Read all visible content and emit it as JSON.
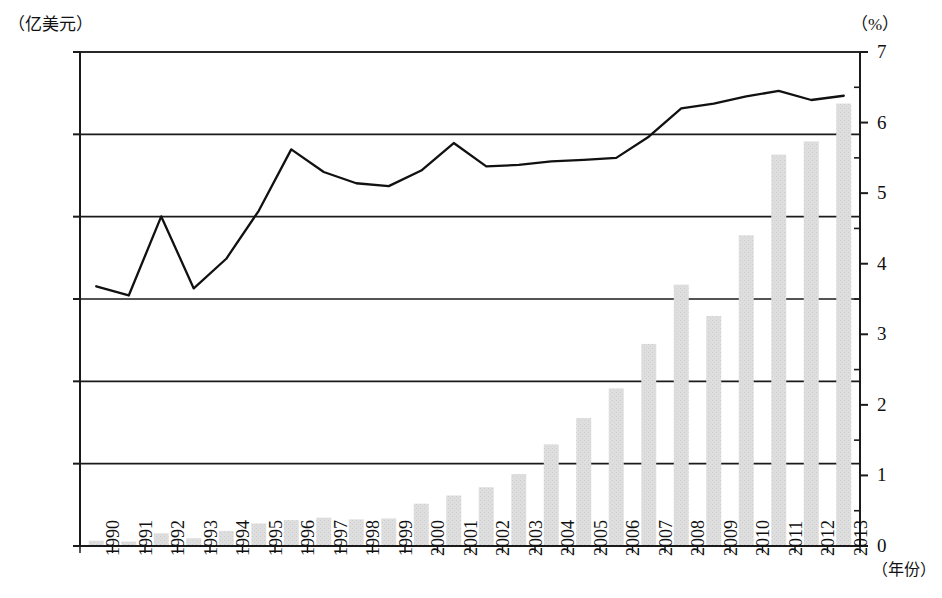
{
  "axes": {
    "left_unit": "（亿美元）",
    "right_unit": "（%）",
    "x_unit": "（年份）",
    "left_ticks": [
      "3 003",
      "2 503",
      "2 003",
      "1 503",
      "1 003",
      "503",
      "3"
    ],
    "right_ticks": [
      "7",
      "6",
      "5",
      "4",
      "3",
      "2",
      "1",
      "0"
    ]
  },
  "chart_data": {
    "type": "bar",
    "title": "",
    "subtitle": "",
    "xlabel": "（年份）",
    "ylabel": "（亿美元）",
    "y2label": "（%）",
    "ylim": [
      3,
      3003
    ],
    "y2lim": [
      0,
      7
    ],
    "ytick_values": [
      3,
      503,
      1003,
      1503,
      2003,
      2503,
      3003
    ],
    "y2tick_values": [
      0,
      1,
      2,
      3,
      4,
      5,
      6,
      7
    ],
    "grid": true,
    "legend": "none",
    "categories": [
      "1990",
      "1991",
      "1992",
      "1993",
      "1994",
      "1995",
      "1996",
      "1997",
      "1998",
      "1999",
      "2000",
      "2001",
      "2002",
      "2003",
      "2004",
      "2005",
      "2006",
      "2007",
      "2008",
      "2009",
      "2010",
      "2011",
      "2012",
      "2013"
    ],
    "series": [
      {
        "name": "金额",
        "type": "bar",
        "axis": "left",
        "unit": "亿美元",
        "color": "#dcdcdc",
        "values": [
          35,
          30,
          80,
          50,
          95,
          140,
          160,
          175,
          165,
          170,
          260,
          310,
          360,
          440,
          620,
          780,
          960,
          1230,
          1590,
          1400,
          1890,
          2380,
          2460,
          2690
        ]
      },
      {
        "name": "占比",
        "type": "line",
        "axis": "right",
        "unit": "%",
        "color": "#111111",
        "values": [
          3.68,
          3.55,
          4.67,
          3.65,
          4.07,
          4.75,
          5.62,
          5.3,
          5.14,
          5.1,
          5.32,
          5.71,
          5.38,
          5.4,
          5.45,
          5.47,
          5.5,
          5.8,
          6.2,
          6.27,
          6.37,
          6.45,
          6.32,
          6.38
        ]
      }
    ]
  }
}
